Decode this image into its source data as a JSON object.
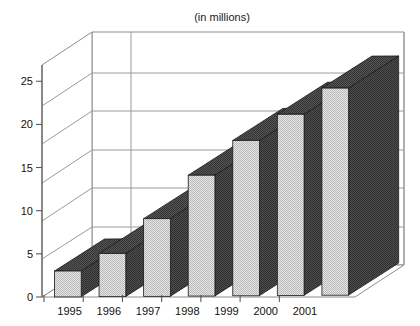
{
  "chart_data": {
    "type": "bar",
    "title": "(in millions)",
    "subtitle": "",
    "xlabel": "",
    "ylabel": "",
    "categories": [
      "1995",
      "1996",
      "1997",
      "1998",
      "1999",
      "2000",
      "2001"
    ],
    "values": [
      3,
      5,
      9,
      14,
      18,
      21,
      24
    ],
    "series": [
      {
        "name": "",
        "values": [
          3,
          5,
          9,
          14,
          18,
          21,
          24
        ]
      }
    ],
    "ylim": [
      0,
      27
    ],
    "yticks": [
      0,
      5,
      10,
      15,
      20,
      25
    ],
    "ytick_labels": [
      "0",
      "5",
      "10",
      "15",
      "20",
      "25"
    ],
    "grid": true,
    "grid_axis": "y",
    "legend": false,
    "legend_position": "none",
    "projection": "3d",
    "annotations": []
  },
  "style": {
    "bar_front_color": "#d6d6d6",
    "bar_side_color": "#4a4a4a",
    "bar_top_color": "#4a4a4a",
    "bar_edge_color": "#1a1a1a",
    "grid_color": "#9a9a9a",
    "axis_color": "#5a5a5a",
    "floor_color": "#ffffff",
    "wall_color": "#ffffff",
    "background": "#ffffff",
    "text_color": "#111111"
  },
  "axes": {
    "title_label": "(in millions)",
    "y_axis_name": "value-axis",
    "x_axis_name": "year-axis"
  }
}
